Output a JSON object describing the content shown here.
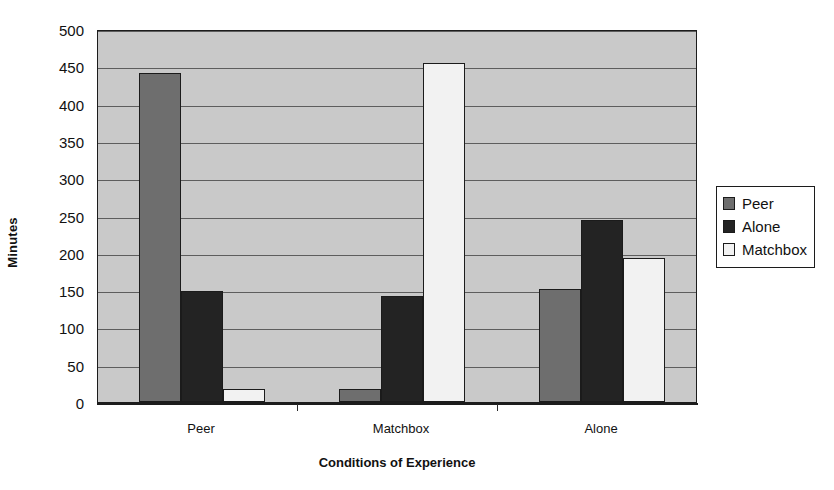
{
  "chart_data": {
    "type": "bar",
    "title": "",
    "xlabel": "Conditions of Experience",
    "ylabel": "Minutes",
    "categories": [
      "Peer",
      "Matchbox",
      "Alone"
    ],
    "series": [
      {
        "name": "Peer",
        "color": "#6e6e6e",
        "values": [
          441,
          17,
          151
        ]
      },
      {
        "name": "Alone",
        "color": "#232323",
        "values": [
          149,
          142,
          244
        ]
      },
      {
        "name": "Matchbox",
        "color": "#f2f2f2",
        "values": [
          17,
          455,
          193
        ]
      }
    ],
    "ylim": [
      0,
      500
    ],
    "ytick_step": 50,
    "yticks": [
      0,
      50,
      100,
      150,
      200,
      250,
      300,
      350,
      400,
      450,
      500
    ],
    "ytick_labels": [
      "0",
      "50",
      "100",
      "150",
      "200",
      "250",
      "300",
      "350",
      "400",
      "450",
      "500"
    ],
    "grid": true,
    "grid_axis": "y",
    "legend_position": "right",
    "plot_background": "#c9c9c9",
    "page_background": "#ffffff",
    "border_color": "#1c1c1c"
  },
  "axes": {
    "y_title": "Minutes",
    "x_title": "Conditions of Experience"
  },
  "legend": {
    "entries": [
      {
        "label": "Peer",
        "color": "#6e6e6e"
      },
      {
        "label": "Alone",
        "color": "#232323"
      },
      {
        "label": "Matchbox",
        "color": "#f2f2f2"
      }
    ]
  }
}
